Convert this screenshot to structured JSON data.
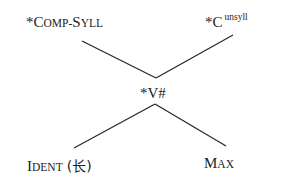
{
  "diagram": {
    "type": "constraint-ranking-hasse",
    "nodes": [
      {
        "id": "comp_syll",
        "star": "*",
        "initial": "C",
        "rest": "OMP-",
        "initial2": "S",
        "rest2": "YLL",
        "full": "*COMP-SYLL"
      },
      {
        "id": "c_unsyll",
        "star": "*",
        "base": "C",
        "superscript": "unsyll",
        "full": "*C^unsyll"
      },
      {
        "id": "v_hash",
        "label": "*V#"
      },
      {
        "id": "ident",
        "initial": "I",
        "rest": "DENT",
        "paren": "(长)",
        "full": "IDENT (长)"
      },
      {
        "id": "max",
        "initial": "M",
        "rest": "AX",
        "full": "MAX"
      }
    ],
    "edges": [
      {
        "from": "comp_syll",
        "to": "v_hash"
      },
      {
        "from": "c_unsyll",
        "to": "v_hash"
      },
      {
        "from": "v_hash",
        "to": "ident"
      },
      {
        "from": "v_hash",
        "to": "max"
      }
    ]
  }
}
